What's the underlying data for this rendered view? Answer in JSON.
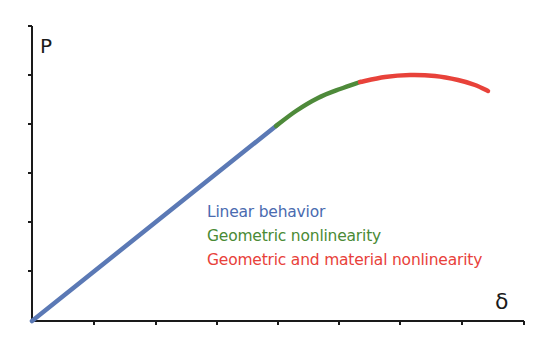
{
  "chart_data": {
    "type": "line",
    "title": "",
    "xlabel": "δ",
    "ylabel": "P",
    "grid": false,
    "legend_position": "center-right (inline text, below curve)",
    "axes": {
      "origin_px": [
        32,
        321
      ],
      "x_end_px": 524,
      "y_top_px": 26,
      "x_ticks_px": [
        94,
        156,
        217,
        278,
        339,
        400,
        462,
        524
      ],
      "y_ticks_px": [
        271,
        222,
        173,
        124,
        75,
        26
      ],
      "tick_labels": "none (qualitative axes)"
    },
    "coordinate_note": "Points are in image pixel coordinates (x right, y down) traced from the figure; the axes carry no numeric values.",
    "series": [
      {
        "name": "Linear behavior",
        "color": "#5b79b5",
        "points": [
          [
            32,
            321
          ],
          [
            276,
            126
          ]
        ]
      },
      {
        "name": "Geometric nonlinearity",
        "color": "#4e8a3a",
        "points": [
          [
            276,
            126
          ],
          [
            296,
            111
          ],
          [
            318,
            98
          ],
          [
            340,
            89
          ],
          [
            360,
            82
          ]
        ]
      },
      {
        "name": "Geometric and material nonlinearity",
        "color": "#e8423a",
        "points": [
          [
            360,
            82
          ],
          [
            385,
            77
          ],
          [
            410,
            75
          ],
          [
            435,
            76
          ],
          [
            458,
            80
          ],
          [
            475,
            85
          ],
          [
            488,
            91
          ]
        ]
      }
    ]
  },
  "labels": {
    "y_axis": "P",
    "x_axis": "δ",
    "legend": [
      {
        "text": "Linear behavior",
        "color": "#4a6bb0"
      },
      {
        "text": "Geometric nonlinearity",
        "color": "#4a8a35"
      },
      {
        "text": "Geometric and material nonlinearity",
        "color": "#e8413a"
      }
    ]
  }
}
